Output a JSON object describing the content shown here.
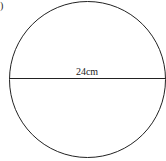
{
  "figure": {
    "partial_label": ")",
    "shape": "circle",
    "diameter_label": "24cm",
    "stroke_color": "#222222",
    "background": "#ffffff"
  }
}
